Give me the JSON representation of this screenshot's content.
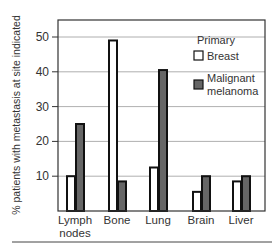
{
  "chart_data": {
    "type": "bar",
    "title": "",
    "xlabel": "",
    "ylabel": "% patients with metastasis at site indicated",
    "ylim": [
      0,
      55
    ],
    "yticks": [
      10,
      20,
      30,
      40,
      50
    ],
    "grid": true,
    "legend_position": "upper right",
    "legend_title": "Primary",
    "categories": [
      "Lymph nodes",
      "Bone",
      "Lung",
      "Brain",
      "Liver"
    ],
    "category_lines": [
      [
        "Lymph",
        "nodes"
      ],
      [
        "Bone"
      ],
      [
        "Lung"
      ],
      [
        "Brain"
      ],
      [
        "Liver"
      ]
    ],
    "series": [
      {
        "name": "Breast",
        "color": "#ffffff",
        "values": [
          10,
          49,
          12.5,
          5.5,
          8.5
        ]
      },
      {
        "name": "Malignant melanoma",
        "legend_lines": [
          "Malignant",
          "melanoma"
        ],
        "color": "#666666",
        "values": [
          25,
          8.5,
          40.5,
          10,
          10
        ]
      }
    ]
  },
  "colors": {
    "axis": "#333333",
    "grid": "#9a9a9a",
    "bar_outline": "#111111"
  }
}
